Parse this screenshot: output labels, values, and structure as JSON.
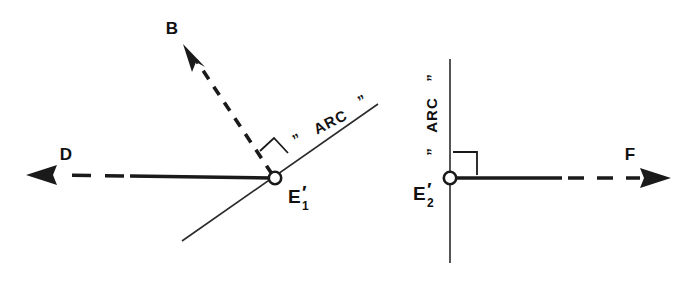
{
  "figure": {
    "background_color": "#ffffff",
    "ink_color": "#1a1a1a",
    "width": 697,
    "height": 282
  },
  "panels": [
    {
      "id": "left-panel",
      "node": {
        "name": "node-e1",
        "base_label": "E",
        "subscript": "1",
        "prime": "′",
        "full_label": "E′₁",
        "x": 275,
        "y": 178
      },
      "arc_line": {
        "name": "arc-line-left",
        "label": "ARC",
        "quote_open": "”",
        "quote_close": "”",
        "label_display": "” ARC ”",
        "orientation": "diagonal",
        "rotation_deg": -27
      },
      "vectors": [
        {
          "name": "vector-b",
          "label": "B",
          "direction": "up-left",
          "style": "dashed",
          "label_x": 172,
          "label_y": 34
        },
        {
          "name": "vector-d",
          "label": "D",
          "direction": "left",
          "style": "solid-then-dashed",
          "label_x": 66,
          "label_y": 160
        }
      ],
      "right_angle": {
        "name": "right-angle-mark-left",
        "symbol": "∟",
        "present": true
      }
    },
    {
      "id": "right-panel",
      "node": {
        "name": "node-e2",
        "base_label": "E",
        "subscript": "2",
        "prime": "′",
        "full_label": "E′₂",
        "x": 450,
        "y": 178
      },
      "arc_line": {
        "name": "arc-line-right",
        "label": "ARC",
        "quote_open": "”",
        "quote_close": "”",
        "label_display": "”ARC”",
        "orientation": "vertical",
        "rotation_deg": -90
      },
      "vectors": [
        {
          "name": "vector-f",
          "label": "F",
          "direction": "right",
          "style": "solid-then-dashed",
          "label_x": 630,
          "label_y": 160
        }
      ],
      "right_angle": {
        "name": "right-angle-mark-right",
        "symbol": "∟",
        "present": true
      }
    }
  ],
  "labels": {
    "b": "B",
    "d": "D",
    "f": "F",
    "e_base": "E",
    "e1_sub": "1",
    "e2_sub": "2",
    "prime": "′",
    "arc": "ARC",
    "quote_open": "”",
    "quote_close": "”"
  }
}
